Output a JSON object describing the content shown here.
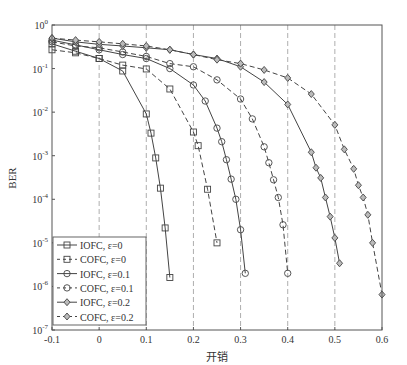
{
  "chart_data": {
    "type": "line",
    "title": "",
    "xlabel": "开销",
    "ylabel": "BER",
    "xlim": [
      -0.1,
      0.6
    ],
    "ylim": [
      1e-07,
      1
    ],
    "yscale": "log",
    "xticks": [
      "-0.1",
      "0",
      "0.1",
      "0.2",
      "0.3",
      "0.4",
      "0.5",
      "0.6"
    ],
    "xtick_values": [
      -0.1,
      0,
      0.1,
      0.2,
      0.3,
      0.4,
      0.5,
      0.6
    ],
    "yticks": [
      "10^0",
      "10^-1",
      "10^-2",
      "10^-3",
      "10^-4",
      "10^-5",
      "10^-6",
      "10^-7"
    ],
    "ytick_exponents": [
      0,
      -1,
      -2,
      -3,
      -4,
      -5,
      -6,
      -7
    ],
    "grid": "vertical dashed at x ticks",
    "legend_position": "lower left",
    "series": [
      {
        "name": "IOFC, ε=0",
        "line": "solid",
        "marker": "square",
        "x": [
          -0.1,
          -0.05,
          0,
          0.05,
          0.1,
          0.11,
          0.12,
          0.13,
          0.14,
          0.15
        ],
        "values": [
          0.37,
          0.25,
          0.17,
          0.088,
          0.0091,
          0.0033,
          0.00089,
          0.00018,
          2.2e-05,
          1.6e-06
        ]
      },
      {
        "name": "COFC, ε=0",
        "line": "dashed",
        "marker": "square",
        "x": [
          -0.1,
          -0.05,
          0,
          0.05,
          0.1,
          0.15,
          0.2,
          0.21,
          0.23,
          0.25
        ],
        "values": [
          0.27,
          0.23,
          0.17,
          0.12,
          0.098,
          0.034,
          0.0035,
          0.0017,
          0.00017,
          1e-05
        ]
      },
      {
        "name": "IOFC, ε=0.1",
        "line": "solid",
        "marker": "circle",
        "x": [
          -0.1,
          -0.05,
          0,
          0.05,
          0.1,
          0.15,
          0.2,
          0.225,
          0.25,
          0.26,
          0.27,
          0.28,
          0.29,
          0.3,
          0.31
        ],
        "values": [
          0.45,
          0.35,
          0.27,
          0.21,
          0.17,
          0.1,
          0.042,
          0.018,
          0.0043,
          0.0021,
          0.00081,
          0.00029,
          0.0001,
          2e-05,
          2e-06
        ]
      },
      {
        "name": "COFC, ε=0.1",
        "line": "dashed",
        "marker": "circle",
        "x": [
          -0.1,
          -0.05,
          0,
          0.05,
          0.1,
          0.15,
          0.2,
          0.25,
          0.3,
          0.325,
          0.35,
          0.36,
          0.37,
          0.38,
          0.39,
          0.4
        ],
        "values": [
          0.41,
          0.33,
          0.3,
          0.24,
          0.19,
          0.13,
          0.11,
          0.055,
          0.02,
          0.007,
          0.0016,
          0.00069,
          0.00028,
          0.00011,
          2.6e-05,
          2e-06
        ]
      },
      {
        "name": "IOFC, ε=0.2",
        "line": "solid",
        "marker": "diamond",
        "x": [
          -0.1,
          -0.05,
          0,
          0.05,
          0.1,
          0.15,
          0.2,
          0.25,
          0.3,
          0.35,
          0.4,
          0.45,
          0.46,
          0.47,
          0.48,
          0.49,
          0.5,
          0.51
        ],
        "values": [
          0.5,
          0.41,
          0.36,
          0.33,
          0.3,
          0.27,
          0.21,
          0.17,
          0.11,
          0.049,
          0.015,
          0.0012,
          0.00053,
          0.00031,
          0.00011,
          4e-05,
          1.3e-05,
          3.4e-06
        ]
      },
      {
        "name": "COFC, ε=0.2",
        "line": "dashed",
        "marker": "diamond",
        "x": [
          -0.1,
          -0.05,
          0,
          0.05,
          0.1,
          0.15,
          0.2,
          0.25,
          0.3,
          0.35,
          0.4,
          0.45,
          0.5,
          0.52,
          0.54,
          0.55,
          0.56,
          0.57,
          0.58,
          0.6
        ],
        "values": [
          0.5,
          0.45,
          0.41,
          0.37,
          0.33,
          0.27,
          0.21,
          0.16,
          0.13,
          0.093,
          0.061,
          0.026,
          0.0051,
          0.0014,
          0.0005,
          0.00021,
          0.00011,
          4.4e-05,
          1e-05,
          6.5e-07
        ]
      }
    ]
  }
}
